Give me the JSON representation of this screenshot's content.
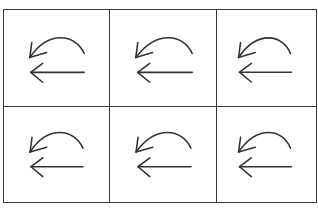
{
  "grid": {
    "rows": 2,
    "columns": 3,
    "border_color": "#3a3a3a",
    "stroke_color": "#333333",
    "cells": [
      {
        "row": 1,
        "col": 1,
        "icon": "undo-back-arrow-icon",
        "label": "Undo / Back"
      },
      {
        "row": 1,
        "col": 2,
        "icon": "undo-back-arrow-icon",
        "label": "Undo / Back"
      },
      {
        "row": 1,
        "col": 3,
        "icon": "undo-back-arrow-icon",
        "label": "Undo / Back"
      },
      {
        "row": 2,
        "col": 1,
        "icon": "undo-back-arrow-icon",
        "label": "Undo / Back"
      },
      {
        "row": 2,
        "col": 2,
        "icon": "undo-back-arrow-icon",
        "label": "Undo / Back"
      },
      {
        "row": 2,
        "col": 3,
        "icon": "undo-back-arrow-icon",
        "label": "Undo / Back"
      }
    ]
  }
}
